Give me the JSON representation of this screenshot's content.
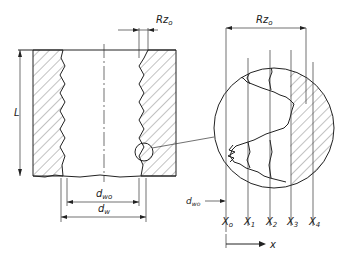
{
  "diagram": {
    "type": "engineering cross-section of bore with surface roughness detail",
    "labels": {
      "length": "L",
      "roughness_top": "Rz",
      "roughness_top_sub": "o",
      "roughness_detail": "Rz",
      "roughness_detail_sub": "o",
      "inner_diameter": "d",
      "inner_diameter_sub": "wo",
      "outer_diameter": "d",
      "outer_diameter_sub": "w",
      "detail_dwo": "d",
      "detail_dwo_sub": "wo",
      "x_axis": "x"
    },
    "positions": [
      {
        "label": "X",
        "sub": "o"
      },
      {
        "label": "X",
        "sub": "1"
      },
      {
        "label": "X",
        "sub": "2"
      },
      {
        "label": "X",
        "sub": "3"
      },
      {
        "label": "X",
        "sub": "4"
      }
    ],
    "colors": {
      "line": "#222222",
      "background": "#ffffff"
    }
  }
}
